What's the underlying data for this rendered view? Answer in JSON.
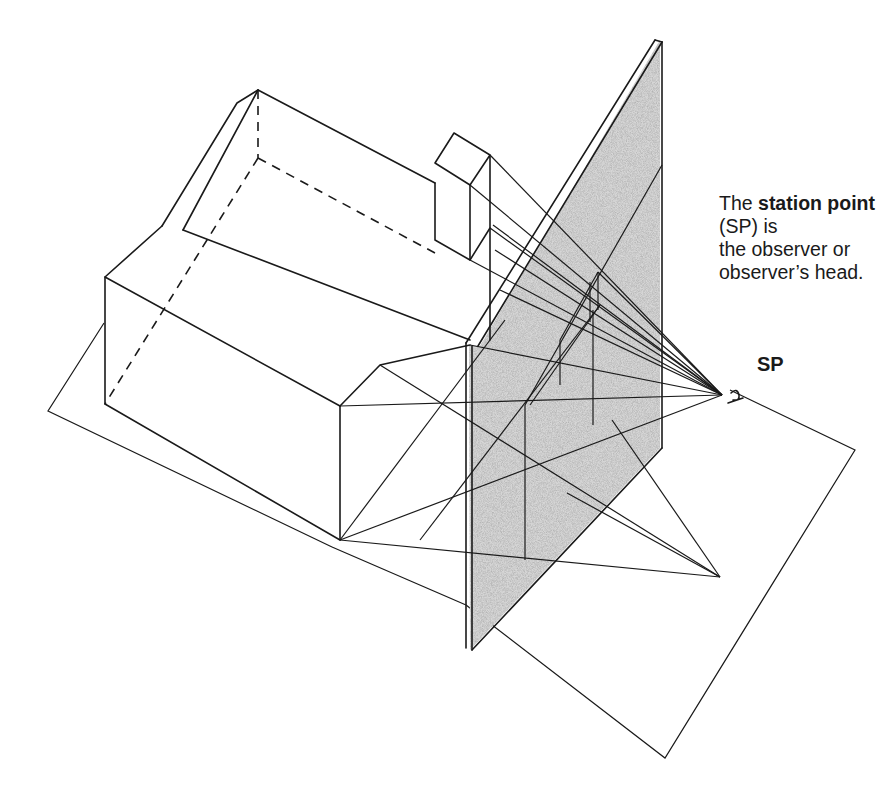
{
  "figure": {
    "caption": {
      "prefix": "The ",
      "term": "station point",
      "suffix_line1": " (SP) is",
      "body": "the observer or observer’s head.",
      "lines": [
        "The station",
        "point (SP) is",
        "the observer",
        "or observer’s",
        "head."
      ]
    },
    "labels": {
      "station_point": "SP"
    },
    "elements": [
      "ground-plane",
      "house",
      "chimney",
      "picture-plane",
      "projection-rays",
      "station-point-eye"
    ],
    "colors": {
      "line": "#1a1a1a",
      "picture_plane_shade": "#b0b0b0",
      "background": "#ffffff"
    }
  }
}
